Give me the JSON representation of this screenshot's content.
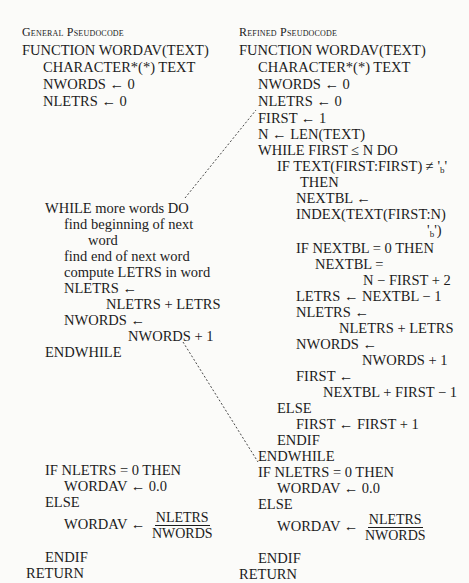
{
  "left": {
    "heading": "General Pseudocode",
    "lines": [
      {
        "text": "FUNCTION   WORDAV(TEXT)",
        "x": 22,
        "y": 42
      },
      {
        "text": "CHARACTER*(*)   TEXT",
        "x": 43,
        "y": 59
      },
      {
        "text": "NWORDS ← 0",
        "x": 43,
        "y": 76
      },
      {
        "text": "NLETRS ← 0",
        "x": 43,
        "y": 93
      },
      {
        "text": "WHILE more words DO",
        "x": 45,
        "y": 200
      },
      {
        "text": "find beginning of next",
        "x": 64,
        "y": 216
      },
      {
        "text": "word",
        "x": 88,
        "y": 232
      },
      {
        "text": "find end of next word",
        "x": 64,
        "y": 248
      },
      {
        "text": "compute LETRS in word",
        "x": 64,
        "y": 264
      },
      {
        "text": "NLETRS ←",
        "x": 64,
        "y": 280
      },
      {
        "text": "NLETRS + LETRS",
        "x": 106,
        "y": 296
      },
      {
        "text": "NWORDS ←",
        "x": 64,
        "y": 312
      },
      {
        "text": "NWORDS + 1",
        "x": 128,
        "y": 328
      },
      {
        "text": "ENDWHILE",
        "x": 45,
        "y": 344
      },
      {
        "text": "IF NLETRS = 0 THEN",
        "x": 45,
        "y": 462
      },
      {
        "text": "WORDAV ← 0.0",
        "x": 64,
        "y": 478
      },
      {
        "text": "ELSE",
        "x": 45,
        "y": 494
      },
      {
        "text": "ENDIF",
        "x": 45,
        "y": 549
      },
      {
        "text": "RETURN",
        "x": 26,
        "y": 565
      }
    ],
    "fraction": {
      "lhs": "WORDAV ←",
      "num": "NLETRS",
      "den": "NWORDS",
      "x": 64,
      "y": 510
    }
  },
  "right": {
    "heading": "Refined Pseudocode",
    "lines": [
      {
        "text": "FUNCTION   WORDAV(TEXT)",
        "x": 239,
        "y": 42
      },
      {
        "text": "CHARACTER*(*)   TEXT",
        "x": 258,
        "y": 59
      },
      {
        "text": "NWORDS ← 0",
        "x": 258,
        "y": 76
      },
      {
        "text": "NLETRS ← 0",
        "x": 258,
        "y": 93
      },
      {
        "text": "FIRST ← 1",
        "x": 258,
        "y": 110
      },
      {
        "text": "N ← LEN(TEXT)",
        "x": 258,
        "y": 126
      },
      {
        "text": "WHILE FIRST ≤ N DO",
        "x": 258,
        "y": 142
      },
      {
        "text": "IF TEXT(FIRST:FIRST) ≠ '",
        "x": 277,
        "y": 158,
        "b": true
      },
      {
        "text": "THEN",
        "x": 300,
        "y": 174
      },
      {
        "text": "NEXTBL ←",
        "x": 296,
        "y": 190
      },
      {
        "text": "INDEX(TEXT(FIRST:N)",
        "x": 296,
        "y": 206
      },
      {
        "text": "'",
        "x": 427,
        "y": 222,
        "b": true,
        "suffix": ")"
      },
      {
        "text": "IF NEXTBL = 0 THEN",
        "x": 296,
        "y": 240
      },
      {
        "text": "NEXTBL =",
        "x": 315,
        "y": 256
      },
      {
        "text": "N − FIRST + 2",
        "x": 363,
        "y": 272
      },
      {
        "text": "LETRS ← NEXTBL − 1",
        "x": 296,
        "y": 288
      },
      {
        "text": "NLETRS ←",
        "x": 296,
        "y": 304
      },
      {
        "text": "NLETRS + LETRS",
        "x": 339,
        "y": 320
      },
      {
        "text": "NWORDS ←",
        "x": 296,
        "y": 336
      },
      {
        "text": "NWORDS + 1",
        "x": 362,
        "y": 352
      },
      {
        "text": "FIRST ←",
        "x": 296,
        "y": 368
      },
      {
        "text": "NEXTBL + FIRST − 1",
        "x": 323,
        "y": 384
      },
      {
        "text": "ELSE",
        "x": 277,
        "y": 400
      },
      {
        "text": "FIRST ← FIRST + 1",
        "x": 296,
        "y": 416
      },
      {
        "text": "ENDIF",
        "x": 277,
        "y": 432
      },
      {
        "text": "ENDWHILE",
        "x": 258,
        "y": 448
      },
      {
        "text": "IF NLETRS = 0 THEN",
        "x": 258,
        "y": 464
      },
      {
        "text": "WORDAV ← 0.0",
        "x": 277,
        "y": 480
      },
      {
        "text": "ELSE",
        "x": 258,
        "y": 496
      },
      {
        "text": "ENDIF",
        "x": 258,
        "y": 550
      },
      {
        "text": "RETURN",
        "x": 239,
        "y": 566
      }
    ],
    "fraction": {
      "lhs": "WORDAV ←",
      "num": "NLETRS",
      "den": "NWORDS",
      "x": 277,
      "y": 512
    }
  },
  "blank_char": "b",
  "connectors": [
    {
      "x1": 185,
      "y1": 198,
      "x2": 256,
      "y2": 110
    },
    {
      "x1": 183,
      "y1": 342,
      "x2": 258,
      "y2": 462
    }
  ]
}
